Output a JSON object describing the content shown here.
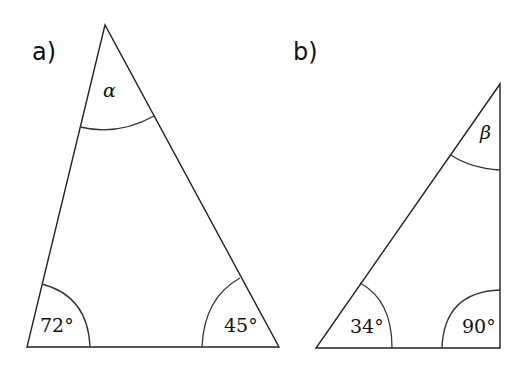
{
  "diagram": {
    "triangles": [
      {
        "id": "a",
        "label": "a)",
        "angles": {
          "top": "α",
          "bottom_left": "72°",
          "bottom_right": "45°"
        }
      },
      {
        "id": "b",
        "label": "b)",
        "angles": {
          "top": "β",
          "bottom_left": "34°",
          "bottom_right": "90°"
        }
      }
    ],
    "colors": {
      "stroke": "#222222",
      "background": "#ffffff"
    }
  }
}
